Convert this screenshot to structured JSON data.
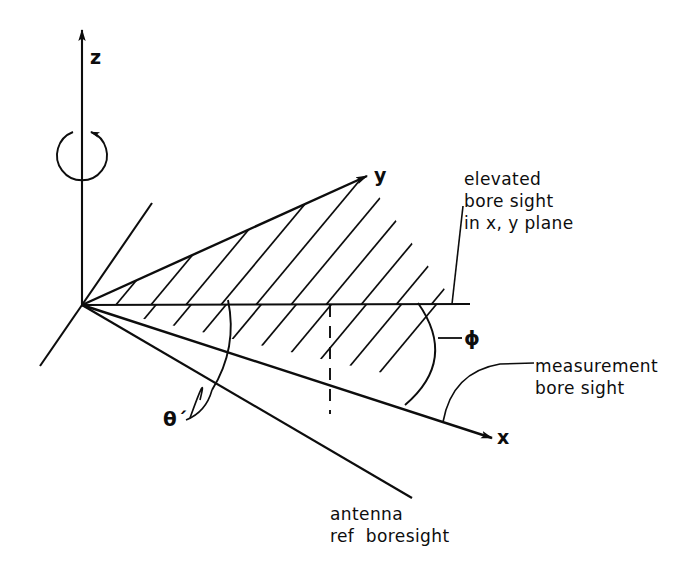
{
  "figure": {
    "ink_color": "#0d0d0d",
    "background_color": "#ffffff",
    "width": 682,
    "height": 565
  },
  "axes": {
    "z_label": "z",
    "y_label": "y",
    "x_label": "x"
  },
  "angles": {
    "phi_label": "ϕ",
    "theta_label": "θ´"
  },
  "annotations": {
    "elevated_boresight": "elevated\nbore sight\nin x, y plane",
    "measurement_boresight": "measurement\nbore sight",
    "antenna_ref_boresight": "antenna\nref  boresight"
  },
  "icons": {
    "rotation_arrow": "rotation-arrow-icon",
    "z_arrowhead": "arrowhead-icon",
    "y_arrowhead": "arrowhead-icon",
    "x_arrowhead": "arrowhead-icon"
  }
}
